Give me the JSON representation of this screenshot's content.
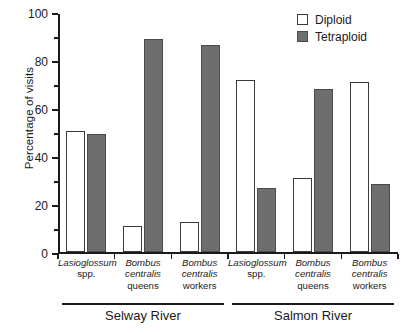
{
  "chart_data": {
    "type": "bar",
    "title": "",
    "xlabel": "",
    "ylabel": "Percentage of visits",
    "ylim": [
      0,
      100
    ],
    "ytick_labels": [
      "0",
      "20",
      "40",
      "60",
      "80",
      "100"
    ],
    "ytick_values": [
      0,
      20,
      40,
      60,
      80,
      100
    ],
    "yminor_values": [
      10,
      30,
      50,
      70,
      90
    ],
    "grid": false,
    "legend_position": "top-right",
    "categories": [
      "Lasioglossum spp.",
      "Bombus centralis queens",
      "Bombus centralis workers",
      "Lasioglossum spp.",
      "Bombus centralis queens",
      "Bombus centralis workers"
    ],
    "category_lines": [
      {
        "genus": "Lasioglossum",
        "detail": "spp.",
        "detail2": ""
      },
      {
        "genus": "Bombus",
        "detail": "centralis",
        "detail2": "queens"
      },
      {
        "genus": "Bombus",
        "detail": "centralis",
        "detail2": "workers"
      },
      {
        "genus": "Lasioglossum",
        "detail": "spp.",
        "detail2": ""
      },
      {
        "genus": "Bombus",
        "detail": "centralis",
        "detail2": "queens"
      },
      {
        "genus": "Bombus",
        "detail": "centralis",
        "detail2": "workers"
      }
    ],
    "series": [
      {
        "name": "Diploid",
        "color": "#ffffff",
        "values": [
          50.5,
          11,
          12.5,
          72,
          31,
          71
        ]
      },
      {
        "name": "Tetraploid",
        "color": "#6e6e6e",
        "values": [
          49.5,
          89,
          86.5,
          27,
          68,
          28.5
        ]
      }
    ],
    "groups": [
      {
        "label": "Selway River",
        "categories": [
          0,
          1,
          2
        ]
      },
      {
        "label": "Salmon River",
        "categories": [
          3,
          4,
          5
        ]
      }
    ]
  },
  "legend": {
    "items": [
      {
        "label": "Diploid",
        "swatch": "open-square"
      },
      {
        "label": "Tetraploid",
        "swatch": "filled-square"
      }
    ]
  },
  "colors": {
    "tetraploid_fill": "#6e6e6e",
    "diploid_fill": "#ffffff",
    "outline": "#3a3a3a",
    "axis": "#1a1a1a"
  }
}
